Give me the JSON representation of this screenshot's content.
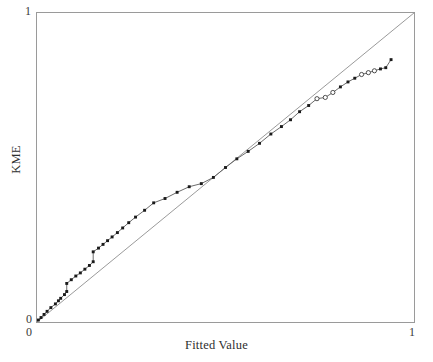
{
  "chart_data": {
    "type": "line",
    "title": "",
    "subtitle": "",
    "xlabel": "Fitted Value",
    "ylabel": "KME",
    "xlim": [
      0,
      1
    ],
    "ylim": [
      0,
      1
    ],
    "xticks": [
      0,
      1
    ],
    "xticklabels": [
      "0",
      "1"
    ],
    "yticks": [
      0,
      1
    ],
    "yticklabels": [
      "0",
      "1"
    ],
    "grid": false,
    "legend": null,
    "annotations": [],
    "series": [
      {
        "name": "Reference line (y = x)",
        "type": "line",
        "style": "solid",
        "color": "#8a8a8a",
        "marker": "none",
        "x": [
          0.0,
          1.0
        ],
        "y": [
          0.0,
          1.0
        ]
      },
      {
        "name": "KME vs Fitted Value",
        "type": "line-with-markers",
        "style": "solid",
        "color": "#555555",
        "marker": "filled-square",
        "marker_color": "#1a1a1a",
        "x": [
          0.005,
          0.012,
          0.02,
          0.028,
          0.038,
          0.05,
          0.058,
          0.064,
          0.074,
          0.08,
          0.08,
          0.092,
          0.104,
          0.116,
          0.128,
          0.14,
          0.15,
          0.15,
          0.164,
          0.176,
          0.188,
          0.2,
          0.214,
          0.228,
          0.244,
          0.262,
          0.286,
          0.31,
          0.34,
          0.372,
          0.404,
          0.436,
          0.468,
          0.5,
          0.53,
          0.56,
          0.59,
          0.62,
          0.648,
          0.672,
          0.696,
          0.72,
          0.742,
          0.764,
          0.784,
          0.804,
          0.824,
          0.842,
          0.86,
          0.878,
          0.894,
          0.91,
          0.924,
          0.938
        ],
        "y": [
          0.008,
          0.016,
          0.026,
          0.036,
          0.048,
          0.06,
          0.07,
          0.078,
          0.09,
          0.1,
          0.126,
          0.138,
          0.15,
          0.16,
          0.172,
          0.184,
          0.196,
          0.228,
          0.24,
          0.252,
          0.264,
          0.276,
          0.29,
          0.305,
          0.322,
          0.34,
          0.362,
          0.386,
          0.4,
          0.42,
          0.438,
          0.448,
          0.468,
          0.5,
          0.528,
          0.552,
          0.578,
          0.608,
          0.632,
          0.654,
          0.68,
          0.7,
          0.722,
          0.726,
          0.742,
          0.76,
          0.776,
          0.788,
          0.8,
          0.806,
          0.812,
          0.818,
          0.822,
          0.848
        ]
      },
      {
        "name": "Censored observations",
        "type": "scatter",
        "marker": "open-circle",
        "marker_color": "#2b2b2b",
        "x": [
          0.742,
          0.764,
          0.784,
          0.86,
          0.878,
          0.894
        ],
        "y": [
          0.722,
          0.726,
          0.742,
          0.8,
          0.806,
          0.812
        ]
      }
    ]
  },
  "axes": {
    "x_title": "Fitted Value",
    "y_title": "KME",
    "x_tick_min": "0",
    "x_tick_max": "1",
    "y_tick_min": "0",
    "y_tick_max": "1"
  },
  "colors": {
    "frame": "#9a9a9a",
    "reference_line": "#8e8e8e",
    "data_line": "#5a5a5a",
    "marker": "#161616",
    "background": "#ffffff",
    "text": "#2e2e2e"
  }
}
